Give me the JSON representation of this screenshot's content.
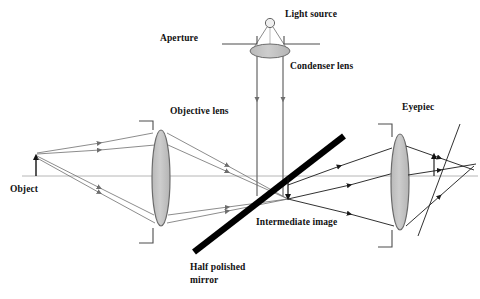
{
  "diagram": {
    "type": "optics-ray-diagram",
    "canvas": {
      "width": 480,
      "height": 299,
      "background": "#ffffff"
    },
    "colors": {
      "ray": "#6e6e6e",
      "ray_dark": "#1a1a1a",
      "axis": "#9a9a9a",
      "lens_fill": "#c6c6c6",
      "lens_stroke": "#6b6b6b",
      "mirror": "#000000",
      "text": "#111111",
      "aperture": "#4d4d4d"
    },
    "labels": {
      "light_source": "Light source",
      "aperture": "Aperture",
      "condenser_lens": "Condenser lens",
      "objective_lens": "Objective lens",
      "object": "Object",
      "intermediate_image": "Intermediate image",
      "half_polished_mirror_line1": "Half polished",
      "half_polished_mirror_line2": "mirror",
      "eyepiece": "Eyepiec"
    },
    "components": [
      {
        "name": "light-source",
        "kind": "point-source",
        "x": 270,
        "y": 23
      },
      {
        "name": "aperture-left",
        "kind": "aperture-blade",
        "x1": 222,
        "x2": 258,
        "y": 44
      },
      {
        "name": "aperture-right",
        "kind": "aperture-blade",
        "x1": 283,
        "x2": 320,
        "y": 44
      },
      {
        "name": "condenser-lens",
        "kind": "lens",
        "cx": 270,
        "cy": 51,
        "rx": 20,
        "ry": 7
      },
      {
        "name": "objective-lens",
        "kind": "lens",
        "cx": 161,
        "cy": 178,
        "rx": 9,
        "ry": 48
      },
      {
        "name": "eyepiece-lens",
        "kind": "lens",
        "cx": 400,
        "cy": 182,
        "rx": 9,
        "ry": 48
      },
      {
        "name": "half-polished-mirror",
        "kind": "mirror",
        "x1": 194,
        "y1": 252,
        "x2": 344,
        "y2": 136
      },
      {
        "name": "object-arrow",
        "kind": "arrow-up",
        "x": 36,
        "y_base": 176,
        "y_tip": 154
      },
      {
        "name": "intermediate-image-arrow",
        "kind": "arrow-down",
        "x": 288,
        "y_base": 178,
        "y_tip": 200
      },
      {
        "name": "final-image-arrow",
        "kind": "arrow-up",
        "x": 434,
        "y_base": 175,
        "y_tip": 154
      },
      {
        "name": "optical-axis",
        "kind": "axis",
        "x1": 22,
        "y1": 176,
        "x2": 478,
        "y2": 176
      }
    ],
    "label_positions": {
      "light_source": {
        "x": 285,
        "y": 17
      },
      "aperture": {
        "x": 160,
        "y": 41
      },
      "condenser_lens": {
        "x": 290,
        "y": 69
      },
      "objective_lens": {
        "x": 170,
        "y": 114
      },
      "object": {
        "x": 10,
        "y": 192
      },
      "intermediate_image": {
        "x": 256,
        "y": 225
      },
      "half_polished_mirror_line1": {
        "x": 190,
        "y": 270
      },
      "half_polished_mirror_line2": {
        "x": 190,
        "y": 282
      },
      "eyepiece": {
        "x": 402,
        "y": 110
      }
    }
  }
}
